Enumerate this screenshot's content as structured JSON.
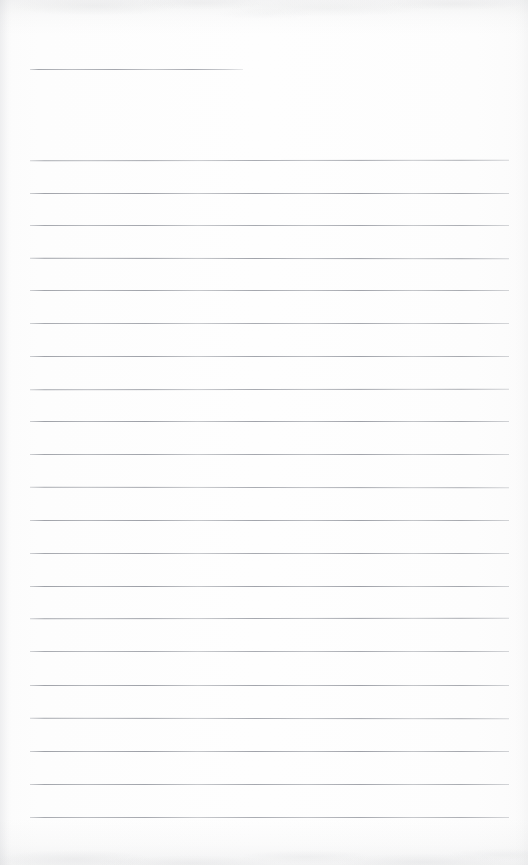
{
  "document": {
    "kind": "scanned-blank-ruled-page",
    "page_width": 528,
    "page_height": 865,
    "paper_color": "#fdfdfd",
    "rule_color": "#9a9da4",
    "text_content": "",
    "handwriting_present": false,
    "typed_text_present": false,
    "header_text": "",
    "page_number": "",
    "margin_rule_present": false
  },
  "header_rule": {
    "label": "short header rule",
    "x": 30,
    "y": 69,
    "width": 213,
    "thickness": 1
  },
  "ruled_lines": {
    "label": "ruled writing lines",
    "count": 21,
    "left_x": 30,
    "right_x": 509,
    "width": 479,
    "spacing": 32.7,
    "thickness": 1,
    "y_positions": [
      160,
      192.5,
      225,
      257.5,
      290,
      323,
      355.5,
      388.5,
      421,
      454,
      487,
      520,
      552.5,
      585.5,
      618,
      651,
      684.5,
      717.5,
      750.5,
      783.5,
      816.5
    ]
  },
  "scan_artifacts": {
    "top_band_height": 34,
    "bottom_band_height": 46,
    "left_edge_width": 12,
    "right_edge_width": 14,
    "noise_color": "#9295 9b"
  }
}
